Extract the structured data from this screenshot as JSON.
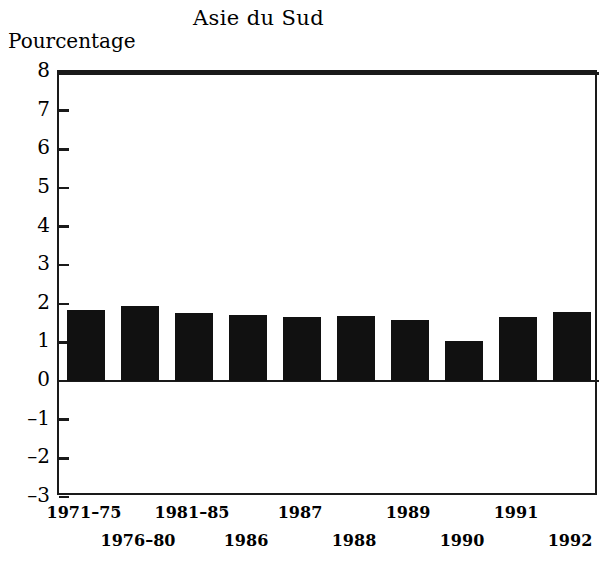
{
  "chart_data": {
    "type": "bar",
    "title": "Asie du Sud",
    "ylabel": "Pourcentage",
    "xlabel": "",
    "categories": [
      "1971–75",
      "1976–80",
      "1981–85",
      "1986",
      "1987",
      "1988",
      "1989",
      "1990",
      "1991",
      "1992"
    ],
    "values": [
      1.85,
      1.95,
      1.75,
      1.7,
      1.65,
      1.68,
      1.57,
      1.05,
      1.67,
      1.8
    ],
    "ylim": [
      -3,
      8
    ],
    "ytick_labels": [
      "8",
      "7",
      "6",
      "5",
      "4",
      "3",
      "2",
      "1",
      "0",
      "–1",
      "–2",
      "–3"
    ],
    "ytick_values": [
      8,
      7,
      6,
      5,
      4,
      3,
      2,
      1,
      0,
      -1,
      -2,
      -3
    ],
    "grid": false,
    "legend": "none",
    "bar_color": "#111111",
    "axis_color": "#1a1a1a",
    "background_color": "#ffffff"
  }
}
